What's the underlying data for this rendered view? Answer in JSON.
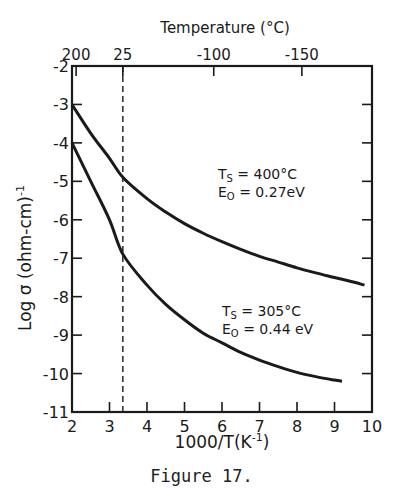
{
  "chart_data": {
    "type": "line",
    "title": "",
    "xlabel": "1000/T(K-1)",
    "ylabel": "Log σ (ohm-cm)-1",
    "top_xlabel": "Temperature (°C)",
    "xlim": [
      2,
      10
    ],
    "ylim": [
      -11,
      -2
    ],
    "x_ticks": [
      2,
      3,
      4,
      5,
      6,
      7,
      8,
      9,
      10
    ],
    "y_ticks": [
      -2,
      -3,
      -4,
      -5,
      -6,
      -7,
      -8,
      -9,
      -10,
      -11
    ],
    "top_ticks": [
      {
        "label": "200",
        "x": 2.11
      },
      {
        "label": "25",
        "x": 3.356
      },
      {
        "label": "-100",
        "x": 5.78
      },
      {
        "label": "-150",
        "x": 8.13
      }
    ],
    "grid": false,
    "reference_line": {
      "x": 3.356,
      "style": "dashed",
      "label": "25 °C"
    },
    "series": [
      {
        "name": "Ts = 400°C, E0 = 0.27eV",
        "annotation": [
          "Ts = 400°C",
          "E0 = 0.27eV"
        ],
        "x": [
          2.0,
          2.5,
          3.0,
          3.36,
          4.0,
          4.5,
          5.0,
          5.5,
          6.0,
          6.5,
          7.0,
          7.5,
          8.0,
          8.5,
          9.0,
          9.5,
          9.8
        ],
        "y": [
          -3.0,
          -3.75,
          -4.4,
          -4.9,
          -5.45,
          -5.8,
          -6.1,
          -6.35,
          -6.57,
          -6.77,
          -6.95,
          -7.1,
          -7.25,
          -7.38,
          -7.5,
          -7.62,
          -7.7
        ]
      },
      {
        "name": "Ts = 305°C, E0 = 0.44eV",
        "annotation": [
          "Ts = 305°C",
          "E0 = 0.44eV"
        ],
        "x": [
          2.0,
          2.5,
          3.0,
          3.36,
          4.0,
          4.5,
          5.0,
          5.5,
          6.0,
          6.5,
          7.0,
          7.5,
          8.0,
          8.5,
          9.0,
          9.2
        ],
        "y": [
          -4.0,
          -5.0,
          -6.0,
          -6.9,
          -7.7,
          -8.2,
          -8.6,
          -8.95,
          -9.2,
          -9.45,
          -9.65,
          -9.82,
          -9.97,
          -10.08,
          -10.17,
          -10.2
        ]
      }
    ]
  },
  "labels": {
    "top_axis_title": "Temperature (°C)",
    "bottom_axis_title": "1000/T(K",
    "bottom_axis_sup": "-1",
    "bottom_axis_close": ")",
    "y_axis_title": "Log σ (ohm-cm)",
    "y_axis_sup": "-1",
    "ann1_line1": "T",
    "ann1_sub1": "S",
    "ann1_rest1": " = 400°C",
    "ann1_line2": "E",
    "ann1_sub2": "O",
    "ann1_rest2": " = 0.27eV",
    "ann2_line1": "T",
    "ann2_sub1": "S",
    "ann2_rest1": " = 305°C",
    "ann2_line2": "E",
    "ann2_sub2": "O",
    "ann2_rest2": " = 0.44 eV",
    "caption": "Figure 17."
  }
}
